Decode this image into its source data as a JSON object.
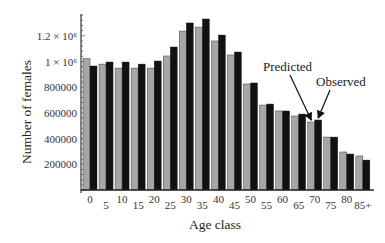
{
  "chart_data": {
    "type": "bar",
    "title": "",
    "xlabel": "Age class",
    "ylabel": "Number of females",
    "ylim": [
      0,
      1400000
    ],
    "grid": false,
    "categories": [
      "0",
      "5",
      "10",
      "15",
      "20",
      "25",
      "30",
      "35",
      "40",
      "45",
      "50",
      "55",
      "60",
      "65",
      "70",
      "75",
      "80",
      "85+"
    ],
    "x_tick_labels": [
      "0",
      "5",
      "10",
      "15",
      "20",
      "25",
      "30",
      "35",
      "40",
      "45",
      "50",
      "55",
      "60",
      "65",
      "70",
      "75",
      "80",
      "85+"
    ],
    "y_ticks": [
      200000,
      400000,
      600000,
      800000,
      1000000,
      1200000
    ],
    "y_tick_labels": [
      "200000",
      "400000",
      "600000",
      "800000",
      "1 × 10⁶",
      "1.2 × 10⁶"
    ],
    "series": [
      {
        "name": "Predicted",
        "color": "#a6a6a6",
        "values": [
          1023000,
          980000,
          949000,
          949000,
          949000,
          1043000,
          1237000,
          1268000,
          1160000,
          1051000,
          825000,
          661000,
          615000,
          576000,
          529000,
          412000,
          296000,
          265000
        ]
      },
      {
        "name": "Observed",
        "color": "#111111",
        "values": [
          965000,
          996000,
          996000,
          980000,
          1004000,
          1113000,
          1300000,
          1331000,
          1206000,
          1074000,
          833000,
          669000,
          615000,
          591000,
          545000,
          412000,
          280000,
          233000
        ]
      }
    ],
    "annotations": [
      {
        "text": "Predicted",
        "points_to": {
          "series": "Predicted",
          "category": "70"
        }
      },
      {
        "text": "Observed",
        "points_to": {
          "series": "Observed",
          "category": "70"
        }
      }
    ]
  }
}
